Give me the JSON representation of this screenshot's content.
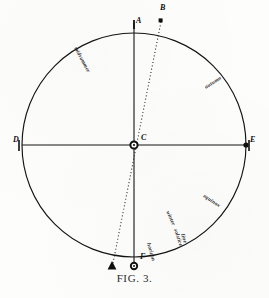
{
  "figure": {
    "caption": "FIG. 3."
  },
  "points": [
    {
      "id": "A",
      "label": "A",
      "x": 134,
      "y": 23,
      "label_x": 136,
      "label_y": 19,
      "desc": "top of vertical diameter"
    },
    {
      "id": "B",
      "label": "B",
      "x": 161,
      "y": 22,
      "label_x": 160,
      "label_y": 10,
      "desc": "upper end of dotted line on circle"
    },
    {
      "id": "C",
      "label": "C",
      "x": 134,
      "y": 145,
      "label_x": 140,
      "label_y": 136,
      "desc": "centre of circle"
    },
    {
      "id": "D",
      "label": "D",
      "x": 22,
      "y": 145,
      "label_x": 14,
      "label_y": 138,
      "desc": "left end of horizontal diameter"
    },
    {
      "id": "E",
      "label": "E",
      "x": 246,
      "y": 145,
      "label_x": 248,
      "label_y": 138,
      "desc": "right end of horizontal diameter"
    },
    {
      "id": "F",
      "label": "F",
      "x": 134,
      "y": 267,
      "label_x": 137,
      "label_y": 262,
      "desc": "bottom of vertical diameter"
    },
    {
      "id": "G",
      "label": "",
      "x": 112,
      "y": 268,
      "label_x": 110,
      "label_y": 272,
      "desc": "lower end of dotted line, triangle marker"
    }
  ],
  "circle": {
    "cx": 134,
    "cy": 145,
    "r": 112,
    "stroke": "#141414",
    "stroke_width": 1.15
  },
  "axes": {
    "vertical": {
      "x1": 134,
      "y1": 23,
      "x2": 134,
      "y2": 267,
      "stroke": "#141414"
    },
    "horizontal": {
      "x1": 22,
      "y1": 145,
      "x2": 246,
      "y2": 145,
      "stroke": "#141414"
    }
  },
  "dotted_line": {
    "x1": 161,
    "y1": 22,
    "x2": 112,
    "y2": 268,
    "stroke": "#1b1b1b",
    "dash": "1,2.4"
  },
  "annotations": [
    {
      "id": "upper-left",
      "text": "midsummer",
      "x": 76,
      "y": 44,
      "rotate": 62
    },
    {
      "id": "upper-right",
      "text": "autumn",
      "x": 205,
      "y": 84,
      "rotate": -32
    },
    {
      "id": "lower-right",
      "text": "equinox",
      "x": 204,
      "y": 192,
      "rotate": 34
    },
    {
      "id": "bottom-mid",
      "text": "winter",
      "x": 168,
      "y": 208,
      "rotate": 66
    },
    {
      "id": "bottom-ctr-a",
      "text": "solstice",
      "x": 176,
      "y": 226,
      "rotate": 72
    },
    {
      "id": "bottom-ctr-b",
      "text": "line",
      "x": 183,
      "y": 231,
      "rotate": 72
    },
    {
      "id": "bottom-left",
      "text": "horizon",
      "x": 149,
      "y": 240,
      "rotate": 74
    }
  ],
  "colors": {
    "ink": "#141414",
    "paper": "#fdfdfc"
  }
}
